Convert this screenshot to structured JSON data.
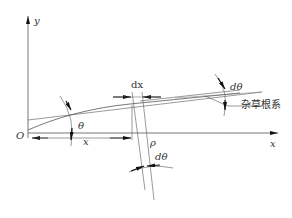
{
  "diagram": {
    "labels": {
      "y_axis": "y",
      "x_axis": "x",
      "origin": "O",
      "theta": "θ",
      "x_length": "x",
      "dx": "dx",
      "rho": "ρ",
      "dtheta_bottom": "dθ",
      "dtheta_top": "dθ",
      "weed_root": "杂草根系"
    },
    "colors": {
      "line": "#555555",
      "arrow": "#111111",
      "text": "#333333",
      "background": "#ffffff"
    }
  }
}
